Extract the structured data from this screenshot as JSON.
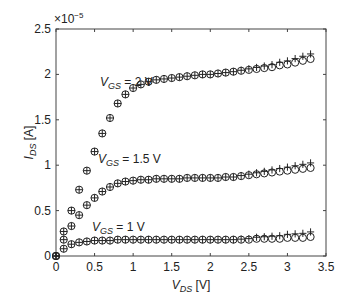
{
  "chart_data": {
    "type": "scatter",
    "title": "",
    "xlabel": "V_DS [V]",
    "ylabel": "I_DS [A]",
    "y_multiplier": "×10^-5",
    "xlim": [
      0,
      3.5
    ],
    "ylim": [
      0,
      2.5
    ],
    "xticks": [
      0,
      0.5,
      1,
      1.5,
      2,
      2.5,
      3,
      3.5
    ],
    "yticks": [
      0,
      0.5,
      1,
      1.5,
      2,
      2.5
    ],
    "grid": false,
    "marker": "circle-plus",
    "x": [
      0,
      0.1,
      0.2,
      0.3,
      0.4,
      0.5,
      0.6,
      0.7,
      0.8,
      0.9,
      1.0,
      1.1,
      1.2,
      1.3,
      1.4,
      1.5,
      1.6,
      1.7,
      1.8,
      1.9,
      2.0,
      2.1,
      2.2,
      2.3,
      2.4,
      2.5,
      2.6,
      2.7,
      2.8,
      2.9,
      3.0,
      3.1,
      3.2,
      3.3
    ],
    "series": [
      {
        "name": "V_GS = 2 V",
        "values": [
          0,
          0.27,
          0.5,
          0.73,
          0.94,
          1.15,
          1.35,
          1.52,
          1.68,
          1.78,
          1.85,
          1.89,
          1.92,
          1.94,
          1.95,
          1.96,
          1.97,
          1.98,
          1.99,
          2.0,
          2.0,
          2.01,
          2.02,
          2.03,
          2.04,
          2.05,
          2.06,
          2.07,
          2.08,
          2.1,
          2.11,
          2.13,
          2.15,
          2.17
        ]
      },
      {
        "name": "V_GS = 1.5 V",
        "values": [
          0,
          0.18,
          0.33,
          0.45,
          0.56,
          0.64,
          0.71,
          0.76,
          0.8,
          0.82,
          0.83,
          0.84,
          0.84,
          0.85,
          0.85,
          0.85,
          0.85,
          0.86,
          0.86,
          0.86,
          0.86,
          0.86,
          0.87,
          0.87,
          0.88,
          0.89,
          0.9,
          0.91,
          0.92,
          0.93,
          0.94,
          0.95,
          0.96,
          0.97
        ]
      },
      {
        "name": "V_GS = 1 V",
        "values": [
          0,
          0.08,
          0.13,
          0.15,
          0.16,
          0.17,
          0.17,
          0.17,
          0.18,
          0.18,
          0.18,
          0.18,
          0.18,
          0.18,
          0.18,
          0.18,
          0.18,
          0.18,
          0.18,
          0.18,
          0.18,
          0.18,
          0.18,
          0.18,
          0.18,
          0.18,
          0.19,
          0.19,
          0.19,
          0.19,
          0.2,
          0.2,
          0.2,
          0.21
        ]
      }
    ],
    "annotations": [
      {
        "text": "V_GS = 2 V",
        "x": 0.35,
        "y": 1.95
      },
      {
        "text": "V_GS = 1.5 V",
        "x": 0.45,
        "y": 1.0
      },
      {
        "text": "V_GS = 1 V",
        "x": 0.4,
        "y": 0.3
      }
    ]
  }
}
